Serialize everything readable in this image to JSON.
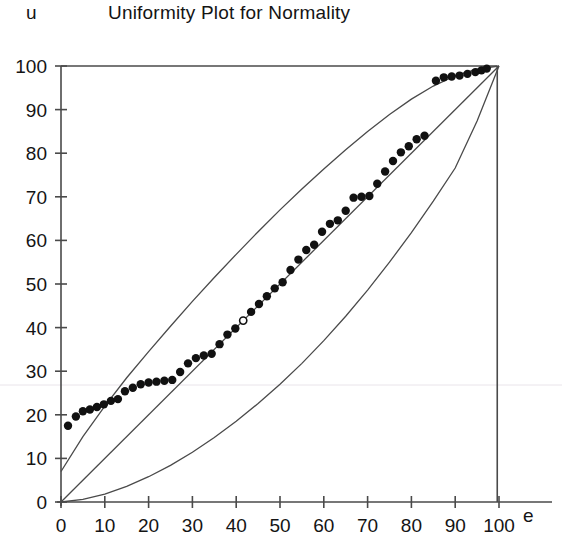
{
  "chart_data": {
    "type": "scatter",
    "title": "Uniformity Plot for Normality",
    "xlabel": "e",
    "ylabel": "u",
    "xlim": [
      0,
      100
    ],
    "ylim": [
      0,
      100
    ],
    "xticks": [
      0,
      10,
      20,
      30,
      40,
      50,
      60,
      70,
      80,
      90,
      100
    ],
    "yticks": [
      0,
      10,
      20,
      30,
      40,
      50,
      60,
      70,
      80,
      90,
      100
    ],
    "xtick_labels": [
      "0",
      "10",
      "20",
      "30",
      "40",
      "50",
      "60",
      "70",
      "80",
      "90",
      "100"
    ],
    "ytick_labels": [
      "0",
      "10",
      "20",
      "30",
      "40",
      "50",
      "60",
      "70",
      "80",
      "90",
      "100"
    ],
    "grid": false,
    "legend": "none",
    "marker_color": "#111111",
    "line_color": "#4a4a4a",
    "series": [
      {
        "name": "Empirical vs uniform points",
        "marker": "filled-circle",
        "x": [
          1.6,
          3.4,
          5.0,
          6.6,
          8.2,
          9.8,
          11.4,
          13.0,
          14.6,
          16.4,
          18.2,
          20.0,
          21.8,
          23.6,
          25.4,
          27.2,
          29.0,
          30.8,
          32.6,
          34.4,
          36.2,
          38.0,
          39.8,
          43.4,
          45.2,
          47.0,
          48.8,
          50.6,
          52.4,
          54.2,
          56.0,
          57.8,
          59.6,
          61.4,
          63.2,
          65.0,
          66.8,
          68.6,
          70.4,
          72.2,
          74.0,
          75.8,
          77.6,
          79.4,
          81.2,
          83.0,
          85.6,
          87.4,
          89.2,
          91.0,
          92.8,
          94.6,
          96.0,
          97.2
        ],
        "y": [
          17.5,
          19.6,
          20.8,
          21.2,
          21.8,
          22.4,
          23.2,
          23.6,
          25.4,
          26.2,
          27.0,
          27.4,
          27.6,
          27.8,
          28.0,
          29.8,
          31.8,
          33.0,
          33.6,
          34.0,
          36.2,
          38.4,
          39.8,
          43.6,
          45.4,
          47.2,
          49.0,
          50.4,
          53.2,
          55.6,
          57.8,
          59.0,
          62.0,
          63.8,
          64.6,
          66.8,
          69.8,
          70.0,
          70.2,
          73.0,
          75.8,
          78.2,
          80.2,
          81.6,
          83.2,
          84.0,
          96.6,
          97.4,
          97.6,
          97.8,
          98.2,
          98.6,
          99.0,
          99.4
        ]
      },
      {
        "name": "Highlighted point",
        "marker": "open-circle",
        "x": [
          41.6
        ],
        "y": [
          41.6
        ]
      }
    ],
    "reference_lines": [
      {
        "name": "diagonal-reference",
        "style": "solid",
        "x": [
          0,
          100
        ],
        "y": [
          0,
          100
        ]
      },
      {
        "name": "upper-confidence-band",
        "style": "solid",
        "x": [
          0,
          5,
          10,
          15,
          20,
          25,
          30,
          35,
          40,
          45,
          50,
          55,
          60,
          65,
          70,
          75,
          80,
          85,
          90,
          95,
          100
        ],
        "y": [
          7.0,
          15.0,
          22.0,
          28.5,
          34.5,
          40.3,
          46.0,
          51.5,
          56.8,
          62.0,
          67.0,
          71.8,
          76.4,
          80.8,
          85.0,
          88.9,
          92.4,
          95.4,
          97.8,
          99.3,
          100.0
        ]
      },
      {
        "name": "lower-confidence-band",
        "style": "solid",
        "x": [
          0,
          5,
          10,
          15,
          20,
          25,
          30,
          35,
          40,
          45,
          50,
          55,
          60,
          65,
          70,
          75,
          80,
          85,
          90,
          95,
          100
        ],
        "y": [
          0.0,
          0.6,
          1.8,
          3.6,
          5.8,
          8.4,
          11.4,
          14.8,
          18.5,
          22.6,
          27.0,
          31.8,
          37.0,
          42.6,
          48.6,
          55.0,
          61.8,
          69.0,
          76.6,
          87.4,
          100.0
        ]
      }
    ]
  }
}
